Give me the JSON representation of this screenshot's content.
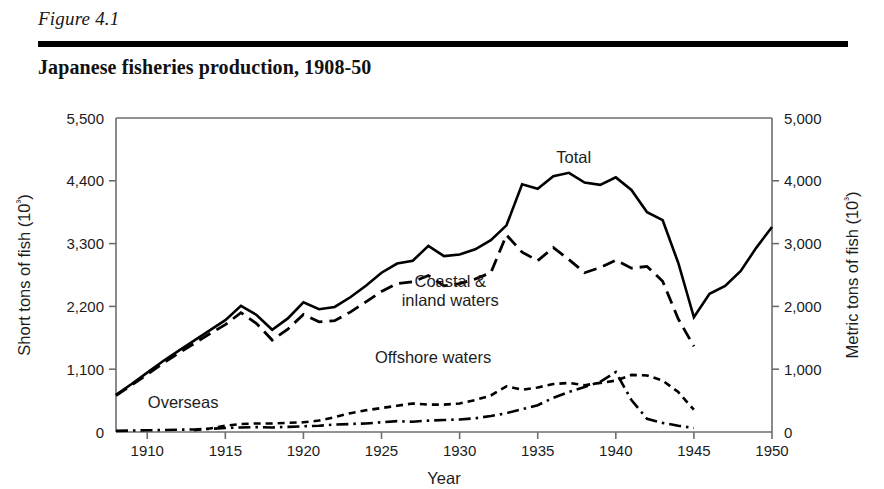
{
  "figure": {
    "number": "Figure 4.1",
    "title": "Japanese fisheries production, 1908-50"
  },
  "chart_data": {
    "type": "line",
    "title": "Japanese fisheries production, 1908-50",
    "xlabel": "Year",
    "ylabel": "Short tons of fish (10³)",
    "y2label": "Metric tons of fish (10³)",
    "xlim": [
      1908,
      1950
    ],
    "ylim": [
      0,
      5500
    ],
    "y2lim": [
      0,
      5000
    ],
    "xticks": [
      1910,
      1915,
      1920,
      1925,
      1930,
      1935,
      1940,
      1945,
      1950
    ],
    "xticklabels": [
      "1910",
      "1915",
      "1920",
      "1925",
      "1930",
      "1935",
      "1940",
      "1945",
      "1950"
    ],
    "yticks": [
      0,
      1100,
      2200,
      3300,
      4400,
      5500
    ],
    "yticklabels": [
      "0",
      "1,100",
      "2,200",
      "3,300",
      "4,400",
      "5,500"
    ],
    "y2ticks": [
      0,
      1000,
      2000,
      3000,
      4000,
      5000
    ],
    "y2ticklabels": [
      "0",
      "1,000",
      "2,000",
      "3,000",
      "4,000",
      "5,000"
    ],
    "grid": false,
    "legend": "inline-annotations",
    "series": [
      {
        "name": "Total",
        "linestyle": "solid",
        "label_position": {
          "x": 1937.3,
          "y": 4720
        },
        "x": [
          1908,
          1909,
          1910,
          1911,
          1912,
          1913,
          1914,
          1915,
          1916,
          1917,
          1918,
          1919,
          1920,
          1921,
          1922,
          1923,
          1924,
          1925,
          1926,
          1927,
          1928,
          1929,
          1930,
          1931,
          1932,
          1933,
          1934,
          1935,
          1936,
          1937,
          1938,
          1939,
          1940,
          1941,
          1942,
          1943,
          1944,
          1945,
          1946,
          1947,
          1948,
          1949,
          1950
        ],
        "y": [
          650,
          840,
          1040,
          1240,
          1420,
          1600,
          1780,
          1960,
          2210,
          2050,
          1790,
          1990,
          2270,
          2150,
          2190,
          2360,
          2560,
          2790,
          2950,
          3000,
          3260,
          3080,
          3110,
          3200,
          3360,
          3620,
          4340,
          4260,
          4480,
          4540,
          4370,
          4330,
          4460,
          4240,
          3850,
          3710,
          2960,
          2010,
          2420,
          2560,
          2820,
          3230,
          3590
        ]
      },
      {
        "name": "Coastal & inland waters",
        "linestyle": "long-dash",
        "label_position": {
          "x": 1929.4,
          "y": 2540
        },
        "label_lines": [
          "Coastal &",
          "inland waters"
        ],
        "x": [
          1908,
          1909,
          1910,
          1911,
          1912,
          1913,
          1914,
          1915,
          1916,
          1917,
          1918,
          1919,
          1920,
          1921,
          1922,
          1923,
          1924,
          1925,
          1926,
          1927,
          1928,
          1929,
          1930,
          1931,
          1932,
          1933,
          1934,
          1935,
          1936,
          1937,
          1938,
          1939,
          1940,
          1941,
          1942,
          1943,
          1944,
          1945
        ],
        "y": [
          640,
          820,
          1010,
          1200,
          1380,
          1550,
          1720,
          1880,
          2090,
          1900,
          1610,
          1800,
          2060,
          1930,
          1950,
          2100,
          2280,
          2460,
          2600,
          2630,
          2740,
          2560,
          2600,
          2680,
          2790,
          3450,
          3150,
          3000,
          3230,
          3020,
          2790,
          2880,
          3010,
          2870,
          2900,
          2640,
          1980,
          1500
        ]
      },
      {
        "name": "Offshore waters",
        "linestyle": "short-dash",
        "label_position": {
          "x": 1928.3,
          "y": 1200
        },
        "x": [
          1913,
          1914,
          1915,
          1916,
          1917,
          1918,
          1919,
          1920,
          1921,
          1922,
          1923,
          1924,
          1925,
          1926,
          1927,
          1928,
          1929,
          1930,
          1931,
          1932,
          1933,
          1934,
          1935,
          1936,
          1937,
          1938,
          1939,
          1940,
          1941,
          1942,
          1943,
          1944,
          1945
        ],
        "y": [
          30,
          60,
          110,
          140,
          150,
          150,
          160,
          170,
          200,
          260,
          330,
          380,
          420,
          460,
          500,
          480,
          480,
          500,
          560,
          640,
          800,
          740,
          780,
          840,
          860,
          820,
          860,
          900,
          1000,
          990,
          900,
          700,
          390
        ]
      },
      {
        "name": "Overseas",
        "linestyle": "dash-dot",
        "label_position": {
          "x": 1912.3,
          "y": 420
        },
        "x": [
          1908,
          1909,
          1910,
          1911,
          1912,
          1913,
          1914,
          1915,
          1916,
          1917,
          1918,
          1919,
          1920,
          1921,
          1922,
          1923,
          1924,
          1925,
          1926,
          1927,
          1928,
          1929,
          1930,
          1931,
          1932,
          1933,
          1934,
          1935,
          1936,
          1937,
          1938,
          1939,
          1940,
          1941,
          1942,
          1943,
          1944,
          1945
        ],
        "y": [
          20,
          25,
          30,
          35,
          40,
          45,
          55,
          70,
          80,
          85,
          80,
          90,
          100,
          110,
          130,
          140,
          150,
          170,
          190,
          180,
          200,
          210,
          220,
          240,
          280,
          330,
          400,
          470,
          600,
          700,
          790,
          880,
          1050,
          560,
          230,
          160,
          110,
          70
        ]
      }
    ]
  }
}
